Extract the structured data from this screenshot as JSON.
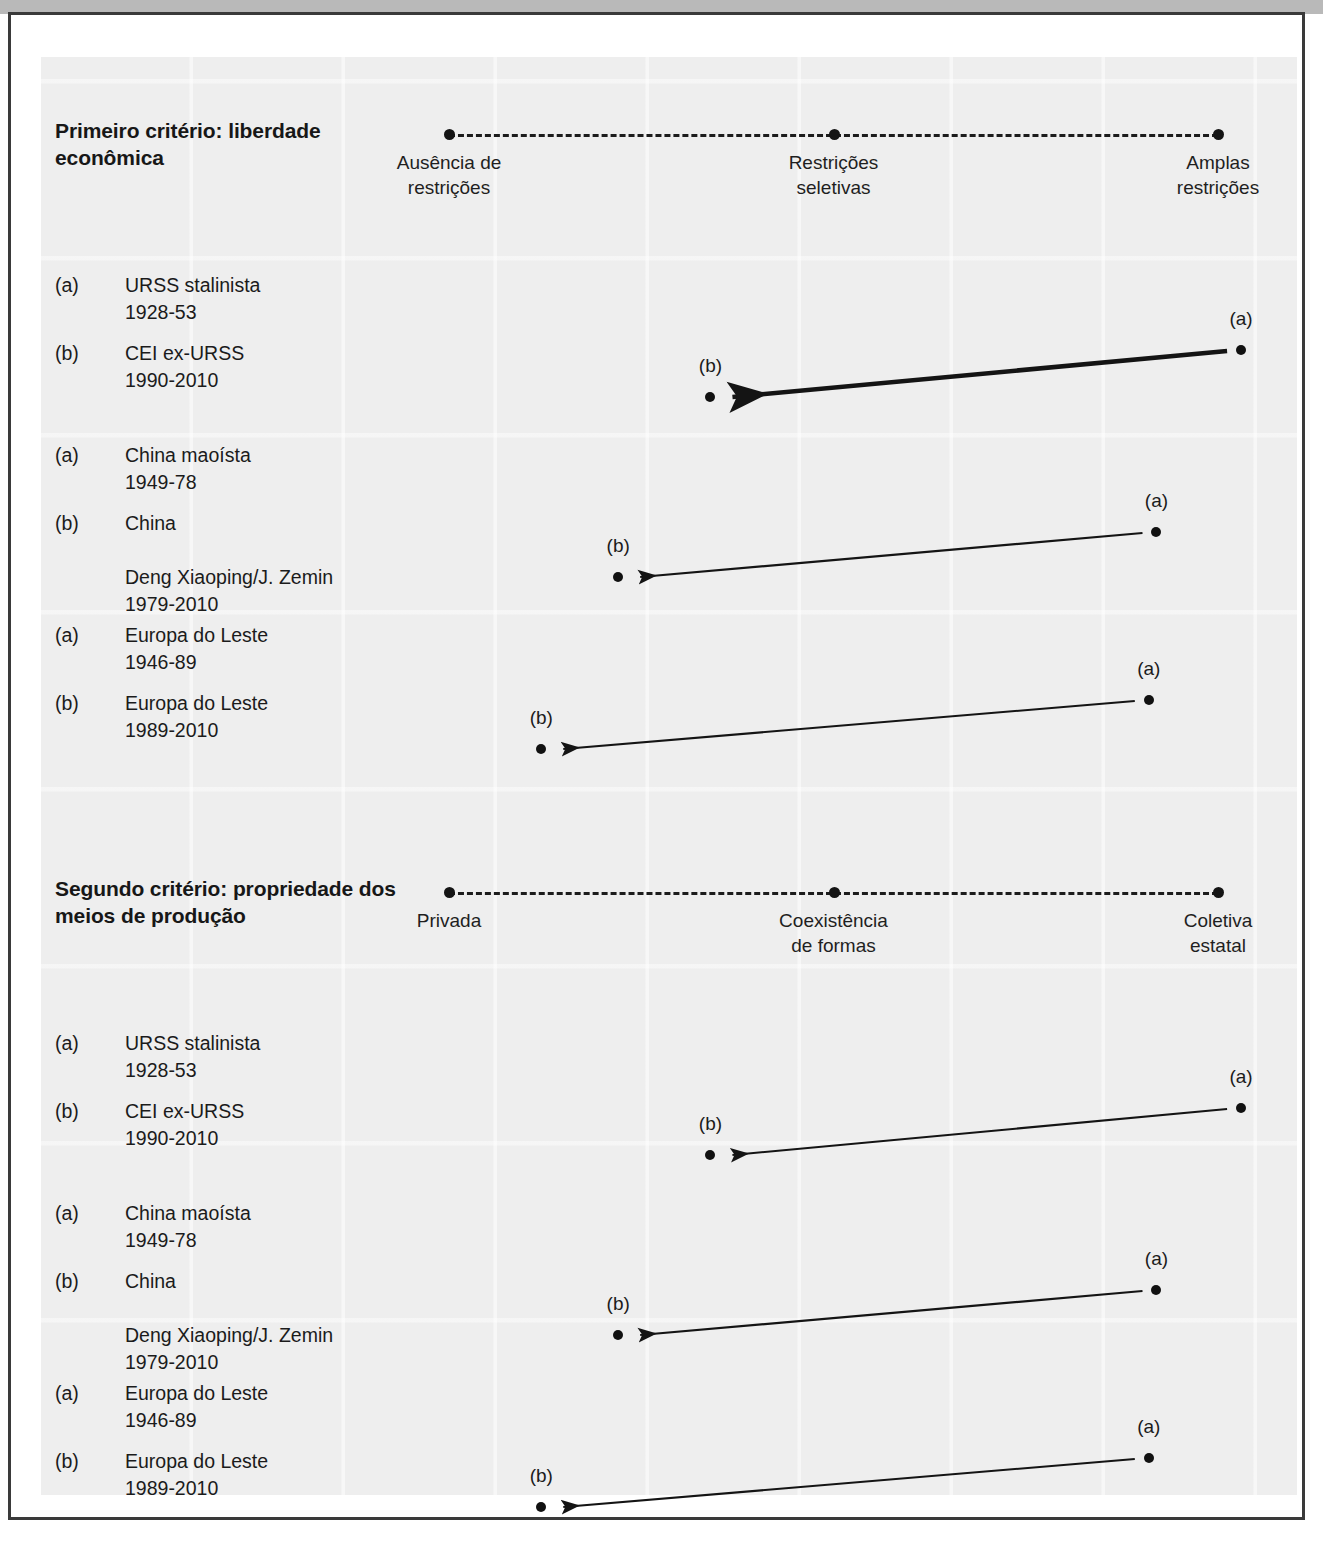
{
  "figure": {
    "sections": [
      {
        "id": "criterio-1",
        "title": "Primeiro critério:\nliberdade econômica",
        "scale": {
          "labels": [
            "Ausência de\nrestrições",
            "Restrições\nseletivas",
            "Amplas\nrestrições"
          ],
          "positions_pct": [
            0,
            50,
            100
          ]
        },
        "groups": [
          {
            "id": "urss",
            "entries": [
              {
                "tag": "(a)",
                "text": "URSS stalinista\n1928-53"
              },
              {
                "tag": "(b)",
                "text": "CEI ex-URSS\n1990-2010"
              }
            ],
            "from": {
              "label": "(a)",
              "value_pct": 103
            },
            "to": {
              "label": "(b)",
              "value_pct": 34
            },
            "emphasis": "heavy"
          },
          {
            "id": "china",
            "entries": [
              {
                "tag": "(a)",
                "text": "China maoísta\n1949-78"
              },
              {
                "tag": "(b)",
                "text": "China\n\nDeng Xiaoping/J. Zemin\n1979-2010"
              }
            ],
            "from": {
              "label": "(a)",
              "value_pct": 92
            },
            "to": {
              "label": "(b)",
              "value_pct": 22
            },
            "emphasis": "light"
          },
          {
            "id": "europa-leste",
            "entries": [
              {
                "tag": "(a)",
                "text": "Europa do Leste\n1946-89"
              },
              {
                "tag": "(b)",
                "text": "Europa do Leste\n1989-2010"
              }
            ],
            "from": {
              "label": "(a)",
              "value_pct": 91
            },
            "to": {
              "label": "(b)",
              "value_pct": 12
            },
            "emphasis": "light"
          }
        ]
      },
      {
        "id": "criterio-2",
        "title": "Segundo critério:\npropriedade dos meios\nde produção",
        "scale": {
          "labels": [
            "Privada",
            "Coexistência\nde formas",
            "Coletiva\nestatal"
          ],
          "positions_pct": [
            0,
            50,
            100
          ]
        },
        "groups": [
          {
            "id": "urss-2",
            "entries": [
              {
                "tag": "(a)",
                "text": "URSS stalinista\n1928-53"
              },
              {
                "tag": "(b)",
                "text": "CEI ex-URSS\n1990-2010"
              }
            ],
            "from": {
              "label": "(a)",
              "value_pct": 103
            },
            "to": {
              "label": "(b)",
              "value_pct": 34
            },
            "emphasis": "light"
          },
          {
            "id": "china-2",
            "entries": [
              {
                "tag": "(a)",
                "text": "China maoísta\n1949-78"
              },
              {
                "tag": "(b)",
                "text": "China\n\nDeng Xiaoping/J. Zemin\n1979-2010"
              }
            ],
            "from": {
              "label": "(a)",
              "value_pct": 92
            },
            "to": {
              "label": "(b)",
              "value_pct": 22
            },
            "emphasis": "light"
          },
          {
            "id": "europa-leste-2",
            "entries": [
              {
                "tag": "(a)",
                "text": "Europa do Leste\n1946-89"
              },
              {
                "tag": "(b)",
                "text": "Europa do Leste\n1989-2010"
              }
            ],
            "from": {
              "label": "(a)",
              "value_pct": 91
            },
            "to": {
              "label": "(b)",
              "value_pct": 12
            },
            "emphasis": "light"
          }
        ]
      }
    ],
    "colors": {
      "ink": "#141414",
      "panel": "#eeeeee",
      "frame": "#3a3a3a"
    }
  },
  "chart_data": {
    "type": "scatter",
    "panels": [
      {
        "name": "Primeiro critério: liberdade econômica",
        "axis_ticks": [
          "Ausência de restrições",
          "Restrições seletivas",
          "Amplas restrições"
        ],
        "axis_tick_positions": [
          0,
          50,
          100
        ],
        "xlim": [
          0,
          100
        ],
        "points": [
          {
            "series": "URSS stalinista 1928-53",
            "label": "(a)",
            "x": 103
          },
          {
            "series": "CEI ex-URSS 1990-2010",
            "label": "(b)",
            "x": 34
          },
          {
            "series": "China maoísta 1949-78",
            "label": "(a)",
            "x": 92
          },
          {
            "series": "China Deng Xiaoping/J. Zemin 1979-2010",
            "label": "(b)",
            "x": 22
          },
          {
            "series": "Europa do Leste 1946-89",
            "label": "(a)",
            "x": 91
          },
          {
            "series": "Europa do Leste 1989-2010",
            "label": "(b)",
            "x": 12
          }
        ],
        "transitions": [
          {
            "from": "(a)",
            "to": "(b)",
            "group": "URSS stalinista → CEI ex-URSS"
          },
          {
            "from": "(a)",
            "to": "(b)",
            "group": "China maoísta → China Deng Xiaoping/J. Zemin"
          },
          {
            "from": "(a)",
            "to": "(b)",
            "group": "Europa do Leste 1946-89 → Europa do Leste 1989-2010"
          }
        ]
      },
      {
        "name": "Segundo critério: propriedade dos meios de produção",
        "axis_ticks": [
          "Privada",
          "Coexistência de formas",
          "Coletiva estatal"
        ],
        "axis_tick_positions": [
          0,
          50,
          100
        ],
        "xlim": [
          0,
          100
        ],
        "points": [
          {
            "series": "URSS stalinista 1928-53",
            "label": "(a)",
            "x": 103
          },
          {
            "series": "CEI ex-URSS 1990-2010",
            "label": "(b)",
            "x": 34
          },
          {
            "series": "China maoísta 1949-78",
            "label": "(a)",
            "x": 92
          },
          {
            "series": "China Deng Xiaoping/J. Zemin 1979-2010",
            "label": "(b)",
            "x": 22
          },
          {
            "series": "Europa do Leste 1946-89",
            "label": "(a)",
            "x": 91
          },
          {
            "series": "Europa do Leste 1989-2010",
            "label": "(b)",
            "x": 12
          }
        ],
        "transitions": [
          {
            "from": "(a)",
            "to": "(b)",
            "group": "URSS stalinista → CEI ex-URSS"
          },
          {
            "from": "(a)",
            "to": "(b)",
            "group": "China maoísta → China Deng Xiaoping/J. Zemin"
          },
          {
            "from": "(a)",
            "to": "(b)",
            "group": "Europa do Leste 1946-89 → Europa do Leste 1989-2010"
          }
        ]
      }
    ],
    "xlabel": "",
    "ylabel": "",
    "grid": false,
    "legend": "none"
  }
}
